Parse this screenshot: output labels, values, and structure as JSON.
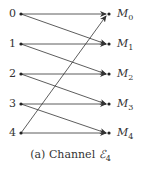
{
  "diagram": {
    "caption_prefix": "(a) Channel ",
    "caption_symbol": "ℰ",
    "caption_sub": "4",
    "inputs": [
      "0",
      "1",
      "2",
      "3",
      "4"
    ],
    "outputs": [
      {
        "base": "M",
        "sub": "0"
      },
      {
        "base": "M",
        "sub": "1"
      },
      {
        "base": "M",
        "sub": "2"
      },
      {
        "base": "M",
        "sub": "3"
      },
      {
        "base": "M",
        "sub": "4"
      }
    ],
    "edges": [
      {
        "from": "0",
        "to": "M0"
      },
      {
        "from": "0",
        "to": "M1"
      },
      {
        "from": "1",
        "to": "M1"
      },
      {
        "from": "1",
        "to": "M2"
      },
      {
        "from": "2",
        "to": "M2"
      },
      {
        "from": "2",
        "to": "M3"
      },
      {
        "from": "3",
        "to": "M3"
      },
      {
        "from": "3",
        "to": "M4"
      },
      {
        "from": "4",
        "to": "M4"
      },
      {
        "from": "4",
        "to": "M0"
      }
    ],
    "line_color": "#333333"
  }
}
